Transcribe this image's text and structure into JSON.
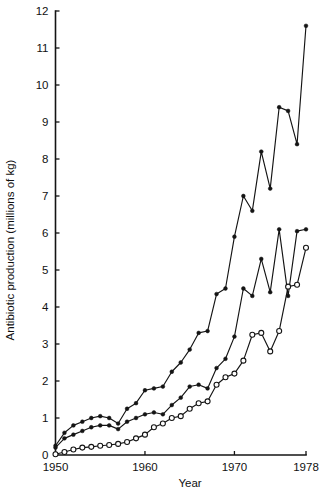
{
  "chart_data": {
    "type": "line",
    "title": "",
    "subtitle": "",
    "xlabel": "Year",
    "ylabel": "Antibiotic production (millions of kg)",
    "xlim": [
      1950,
      1978
    ],
    "ylim": [
      0,
      12
    ],
    "xticks": [
      1950,
      1960,
      1970,
      1978
    ],
    "xtick_labels": [
      "1950",
      "1960",
      "1970",
      "1978"
    ],
    "yticks": [
      0,
      1,
      2,
      3,
      4,
      5,
      6,
      7,
      8,
      9,
      10,
      11,
      12
    ],
    "ytick_labels": [
      "0",
      "1",
      "2",
      "3",
      "4",
      "5",
      "6",
      "7",
      "8",
      "9",
      "10",
      "11",
      "12"
    ],
    "grid": false,
    "legend": "none",
    "x": [
      1950,
      1951,
      1952,
      1953,
      1954,
      1955,
      1956,
      1957,
      1958,
      1959,
      1960,
      1961,
      1962,
      1963,
      1964,
      1965,
      1966,
      1967,
      1968,
      1969,
      1970,
      1971,
      1972,
      1973,
      1974,
      1975,
      1976,
      1977,
      1978
    ],
    "series": [
      {
        "name": "Total antibiotic production",
        "marker": "filled-circle",
        "values": [
          0.25,
          0.6,
          0.8,
          0.9,
          1.0,
          1.05,
          1.0,
          0.85,
          1.25,
          1.4,
          1.75,
          1.8,
          1.85,
          2.25,
          2.5,
          2.85,
          3.3,
          3.35,
          4.35,
          4.5,
          5.9,
          7.0,
          6.6,
          8.2,
          7.2,
          9.4,
          9.3,
          8.4,
          11.6
        ]
      },
      {
        "name": "Intermediate series",
        "marker": "filled-circle",
        "values": [
          0.2,
          0.45,
          0.55,
          0.65,
          0.75,
          0.8,
          0.8,
          0.7,
          0.9,
          1.0,
          1.1,
          1.15,
          1.1,
          1.35,
          1.55,
          1.85,
          1.9,
          1.8,
          2.35,
          2.6,
          3.2,
          4.5,
          4.3,
          5.3,
          4.4,
          6.1,
          4.3,
          6.05,
          6.1
        ]
      },
      {
        "name": "Lower series",
        "marker": "open-circle",
        "values": [
          0.02,
          0.08,
          0.15,
          0.2,
          0.22,
          0.25,
          0.27,
          0.3,
          0.35,
          0.45,
          0.55,
          0.75,
          0.85,
          1.0,
          1.05,
          1.25,
          1.4,
          1.45,
          1.9,
          2.1,
          2.2,
          2.55,
          3.25,
          3.3,
          2.8,
          3.35,
          4.55,
          4.6,
          5.6
        ]
      }
    ]
  }
}
